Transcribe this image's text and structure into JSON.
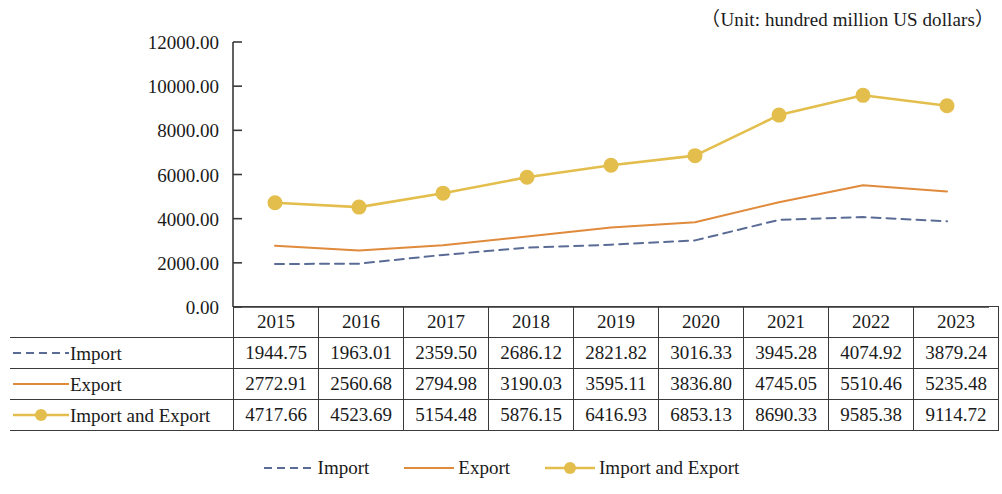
{
  "unit_caption": "（Unit: hundred million US dollars）",
  "colors": {
    "import": "#5a6c96",
    "export": "#e08a3c",
    "import_and_export": "#e3be4c",
    "axis": "#3a3a3a",
    "text": "#1a1a1a"
  },
  "table": {
    "header_label": "",
    "columns": [
      "2015",
      "2016",
      "2017",
      "2018",
      "2019",
      "2020",
      "2021",
      "2022",
      "2023"
    ],
    "rows": [
      {
        "label": "Import",
        "style": "dashed",
        "values": [
          "1944.75",
          "1963.01",
          "2359.50",
          "2686.12",
          "2821.82",
          "3016.33",
          "3945.28",
          "4074.92",
          "3879.24"
        ]
      },
      {
        "label": "Export",
        "style": "solid",
        "values": [
          "2772.91",
          "2560.68",
          "2794.98",
          "3190.03",
          "3595.11",
          "3836.80",
          "4745.05",
          "5510.46",
          "5235.48"
        ]
      },
      {
        "label": "Import and Export",
        "style": "marker",
        "values": [
          "4717.66",
          "4523.69",
          "5154.48",
          "5876.15",
          "6416.93",
          "6853.13",
          "8690.33",
          "9585.38",
          "9114.72"
        ]
      }
    ]
  },
  "legend": {
    "items": [
      {
        "label": "Import",
        "style": "dashed"
      },
      {
        "label": "Export",
        "style": "solid"
      },
      {
        "label": "Import and Export",
        "style": "marker"
      }
    ]
  },
  "chart_data": {
    "type": "line",
    "title": "",
    "subtitle": "",
    "xlabel": "",
    "ylabel": "",
    "unit": "hundred million US dollars",
    "categories": [
      "2015",
      "2016",
      "2017",
      "2018",
      "2019",
      "2020",
      "2021",
      "2022",
      "2023"
    ],
    "ylim": [
      0,
      12000
    ],
    "ytick_labels": [
      "0.00",
      "2000.00",
      "4000.00",
      "6000.00",
      "8000.00",
      "10000.00",
      "12000.00"
    ],
    "ytick_values": [
      0,
      2000,
      4000,
      6000,
      8000,
      10000,
      12000
    ],
    "grid": false,
    "legend_position": "bottom",
    "series": [
      {
        "name": "Import",
        "style": "dashed",
        "color": "#5a6c96",
        "marker": "none",
        "values": [
          1944.75,
          1963.01,
          2359.5,
          2686.12,
          2821.82,
          3016.33,
          3945.28,
          4074.92,
          3879.24
        ]
      },
      {
        "name": "Export",
        "style": "solid",
        "color": "#e08a3c",
        "marker": "none",
        "values": [
          2772.91,
          2560.68,
          2794.98,
          3190.03,
          3595.11,
          3836.8,
          4745.05,
          5510.46,
          5235.48
        ]
      },
      {
        "name": "Import and Export",
        "style": "solid",
        "color": "#e3be4c",
        "marker": "circle",
        "values": [
          4717.66,
          4523.69,
          5154.48,
          5876.15,
          6416.93,
          6853.13,
          8690.33,
          9585.38,
          9114.72
        ]
      }
    ]
  }
}
